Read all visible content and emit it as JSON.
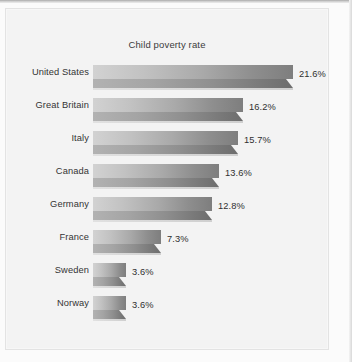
{
  "chart_data": {
    "type": "bar",
    "orientation": "horizontal",
    "title": "Child poverty rate",
    "xlabel": "",
    "ylabel": "",
    "categories": [
      "United States",
      "Great Britain",
      "Italy",
      "Canada",
      "Germany",
      "France",
      "Sweden",
      "Norway"
    ],
    "values": [
      21.6,
      16.2,
      15.7,
      13.6,
      12.8,
      7.3,
      3.6,
      3.6
    ],
    "value_labels": [
      "21.6%",
      "16.2%",
      "15.7%",
      "13.6%",
      "12.8%",
      "7.3%",
      "3.6%",
      "3.6%"
    ],
    "unit": "%",
    "xlim": [
      0,
      21.6
    ],
    "grid": false,
    "legend": false,
    "style": "3d-gradient-bars",
    "colors": {
      "background": "#f3f3f3",
      "page": "#fbfbfb",
      "bar_light": "#d2d2d2",
      "bar_dark": "#6d6d6d",
      "bar_front": "#8f8f8f",
      "text": "#333333",
      "title_text": "#3b3b3b"
    }
  },
  "rows": [
    {
      "category": "United States",
      "value": 21.6,
      "label": "21.6%"
    },
    {
      "category": "Great Britain",
      "value": 16.2,
      "label": "16.2%"
    },
    {
      "category": "Italy",
      "value": 15.7,
      "label": "15.7%"
    },
    {
      "category": "Canada",
      "value": 13.6,
      "label": "13.6%"
    },
    {
      "category": "Germany",
      "value": 12.8,
      "label": "12.8%"
    },
    {
      "category": "France",
      "value": 7.3,
      "label": "7.3%"
    },
    {
      "category": "Sweden",
      "value": 3.6,
      "label": "3.6%"
    },
    {
      "category": "Norway",
      "value": 3.6,
      "label": "3.6%"
    }
  ]
}
